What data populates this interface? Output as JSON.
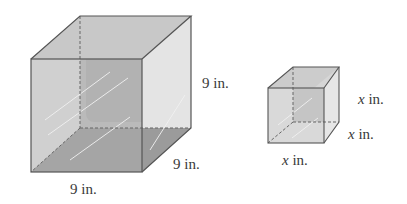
{
  "figure": {
    "large_cube": {
      "edge_labels": {
        "height": "9 in.",
        "depth": "9 in.",
        "width": "9 in."
      }
    },
    "small_cube": {
      "edge_labels": {
        "height_var": "x",
        "height_unit": " in.",
        "depth_var": "x",
        "depth_unit": " in.",
        "width_var": "x",
        "width_unit": " in."
      }
    },
    "colors": {
      "edge": "#555555",
      "face_dark": "#a9a9a9",
      "face_mid": "#c4c4c4",
      "face_light": "#e2e2e2"
    }
  }
}
